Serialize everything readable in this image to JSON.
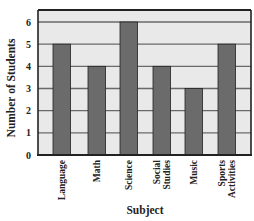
{
  "chart_data": {
    "type": "bar",
    "title": "",
    "xlabel": "Subject",
    "ylabel": "Number of Students",
    "categories": [
      "Language",
      "Math",
      "Science",
      "Social Studies",
      "Music",
      "Sports Activities"
    ],
    "category_label_lines": [
      [
        "Language"
      ],
      [
        "Math"
      ],
      [
        "Science"
      ],
      [
        "Social",
        "Studies"
      ],
      [
        "Music"
      ],
      [
        "Sports",
        "Activities"
      ]
    ],
    "values": [
      5,
      4,
      6,
      4,
      3,
      5
    ],
    "yticks": [
      0,
      1,
      2,
      3,
      4,
      5,
      6
    ],
    "ylim": [
      0,
      6.5
    ],
    "grid": true,
    "legend": null,
    "colors": {
      "bar": "#6b6b6b",
      "bar_edge": "#222222",
      "plot_bg": "#e9e9e9",
      "grid": "#6a6a6a",
      "frame": "#222222"
    }
  }
}
